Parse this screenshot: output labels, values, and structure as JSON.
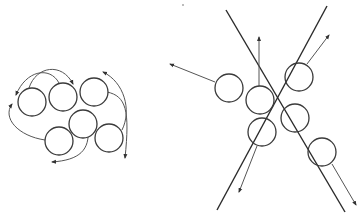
{
  "figure": {
    "colors": {
      "stroke": "#3a3a3a",
      "line": "#2a2a2a",
      "arrow": "#555555",
      "background": "#ffffff"
    },
    "left_panel": {
      "circles": [
        {
          "cx": 32,
          "cy": 102,
          "r": 14
        },
        {
          "cx": 63,
          "cy": 97,
          "r": 14
        },
        {
          "cx": 94,
          "cy": 92,
          "r": 14
        },
        {
          "cx": 83,
          "cy": 124,
          "r": 14
        },
        {
          "cx": 59,
          "cy": 141,
          "r": 14
        },
        {
          "cx": 109,
          "cy": 138,
          "r": 14
        }
      ],
      "curved_arrows": [
        {
          "d": "M 29 88 C 36 66, 62 62, 73 84"
        },
        {
          "d": "M 59 83 C 50 66, 26 70, 16 95"
        },
        {
          "d": "M 45 140 C 18 136, 2 118, 12 104"
        },
        {
          "d": "M 107 92 C 126 96, 130 110, 125 158"
        },
        {
          "d": "M 122 130 C 132 110, 124 82, 103 72"
        },
        {
          "d": "M 88 128 C 90 150, 80 160, 52 162"
        }
      ]
    },
    "right_panel": {
      "lines": [
        {
          "x1": 226,
          "y1": 10,
          "x2": 345,
          "y2": 212
        },
        {
          "x1": 327,
          "y1": 6,
          "x2": 217,
          "y2": 210
        }
      ],
      "circles": [
        {
          "cx": 229,
          "cy": 88,
          "r": 14
        },
        {
          "cx": 260,
          "cy": 100,
          "r": 14
        },
        {
          "cx": 299,
          "cy": 77,
          "r": 14
        },
        {
          "cx": 262,
          "cy": 132,
          "r": 14
        },
        {
          "cx": 295,
          "cy": 118,
          "r": 14
        },
        {
          "cx": 322,
          "cy": 152,
          "r": 14
        }
      ],
      "straight_arrows": [
        {
          "x1": 215,
          "y1": 82,
          "x2": 170,
          "y2": 64
        },
        {
          "x1": 259,
          "y1": 86,
          "x2": 259,
          "y2": 37
        },
        {
          "x1": 307,
          "y1": 64,
          "x2": 329,
          "y2": 35
        },
        {
          "x1": 257,
          "y1": 146,
          "x2": 239,
          "y2": 192
        },
        {
          "x1": 332,
          "y1": 164,
          "x2": 356,
          "y2": 205
        }
      ],
      "stray_mark": {
        "cx": 183,
        "cy": 5,
        "r": 0.8
      }
    }
  }
}
